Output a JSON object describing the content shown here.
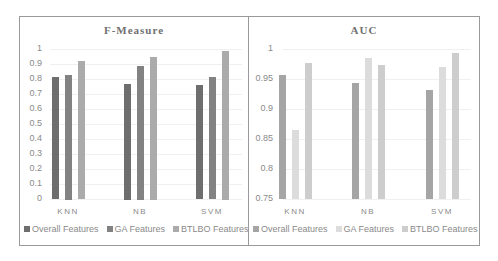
{
  "chart_data": [
    {
      "type": "bar",
      "title": "F-Measure",
      "categories": [
        "KNN",
        "NB",
        "SVM"
      ],
      "series": [
        {
          "name": "Overall Features",
          "values": [
            0.81,
            0.77,
            0.76
          ],
          "color": "#6e6e6e"
        },
        {
          "name": "GA Features",
          "values": [
            0.83,
            0.89,
            0.81
          ],
          "color": "#828282"
        },
        {
          "name": "BTLBO Features",
          "values": [
            0.92,
            0.95,
            0.99
          ],
          "color": "#ababab"
        }
      ],
      "xlabel": "",
      "ylabel": "",
      "ylim": [
        0,
        1
      ],
      "yticks": [
        "1",
        "0.9",
        "0.8",
        "0.7",
        "0.6",
        "0.5",
        "0.4",
        "0.3",
        "0.2",
        "0.1",
        "0"
      ],
      "grid": true,
      "legend_position": "bottom"
    },
    {
      "type": "bar",
      "title": "AUC",
      "categories": [
        "KNN",
        "NB",
        "SVM"
      ],
      "series": [
        {
          "name": "Overall Features",
          "values": [
            0.957,
            0.943,
            0.932
          ],
          "color": "#a5a5a5"
        },
        {
          "name": "GA Features",
          "values": [
            0.865,
            0.985,
            0.97
          ],
          "color": "#dcdcdc"
        },
        {
          "name": "BTLBO Features",
          "values": [
            0.977,
            0.973,
            0.993
          ],
          "color": "#cdcdcd"
        }
      ],
      "xlabel": "",
      "ylabel": "",
      "ylim": [
        0.75,
        1
      ],
      "yticks": [
        "1",
        "0.95",
        "0.9",
        "0.85",
        "0.8",
        "0.75"
      ],
      "grid": true,
      "legend_position": "bottom"
    }
  ]
}
